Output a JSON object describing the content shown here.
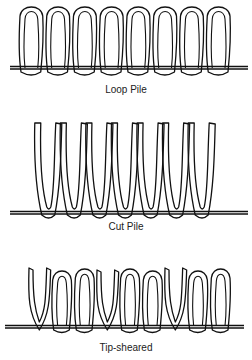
{
  "diagrams": [
    {
      "id": "loop",
      "label": "Loop Pile",
      "loops": 8
    },
    {
      "id": "cut",
      "label": "Cut Pile",
      "tufts": 7
    },
    {
      "id": "tip",
      "label": "Tip-sheared",
      "loops": 9
    }
  ],
  "colors": {
    "stroke": "#111111",
    "background": "#ffffff",
    "text": "#222222"
  }
}
